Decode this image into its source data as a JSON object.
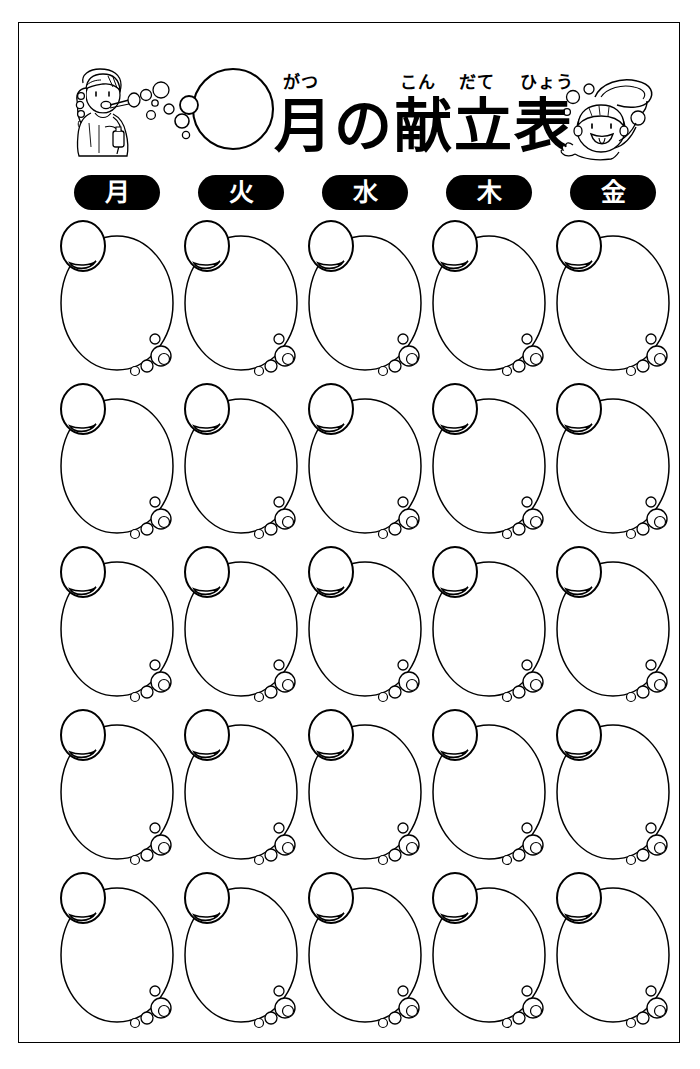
{
  "document": {
    "title": "月の献立表",
    "title_segments": [
      "月",
      "の",
      "献",
      "立",
      "表"
    ],
    "furigana": {
      "gatsu": "がつ",
      "kon": "こん",
      "date": "だて",
      "hyou": "ひょう"
    },
    "month_value": "",
    "ink_color": "#000000",
    "paper_color": "#ffffff"
  },
  "illustrations": {
    "left": "girl-blowing-bubbles-icon",
    "right": "boy-with-bubble-wand-icon",
    "month_circle": "month-number-circle-icon"
  },
  "days": [
    {
      "label": "月",
      "name": "monday"
    },
    {
      "label": "火",
      "name": "tuesday"
    },
    {
      "label": "水",
      "name": "wednesday"
    },
    {
      "label": "木",
      "name": "thursday"
    },
    {
      "label": "金",
      "name": "friday"
    }
  ],
  "grid": {
    "rows": 5,
    "columns": 5,
    "cell_shape": "soap-bubble",
    "cells": [
      [
        {
          "value": ""
        },
        {
          "value": ""
        },
        {
          "value": ""
        },
        {
          "value": ""
        },
        {
          "value": ""
        }
      ],
      [
        {
          "value": ""
        },
        {
          "value": ""
        },
        {
          "value": ""
        },
        {
          "value": ""
        },
        {
          "value": ""
        }
      ],
      [
        {
          "value": ""
        },
        {
          "value": ""
        },
        {
          "value": ""
        },
        {
          "value": ""
        },
        {
          "value": ""
        }
      ],
      [
        {
          "value": ""
        },
        {
          "value": ""
        },
        {
          "value": ""
        },
        {
          "value": ""
        },
        {
          "value": ""
        }
      ],
      [
        {
          "value": ""
        },
        {
          "value": ""
        },
        {
          "value": ""
        },
        {
          "value": ""
        },
        {
          "value": ""
        }
      ]
    ]
  },
  "layout": {
    "column_centers": [
      98,
      222,
      346,
      470,
      594
    ],
    "row_tops": [
      0,
      163,
      326,
      489,
      652
    ]
  }
}
